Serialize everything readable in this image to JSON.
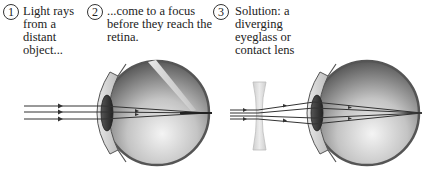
{
  "diagram": {
    "steps": [
      {
        "number": "1",
        "text": "Light rays\nfrom a\ndistant\nobject..."
      },
      {
        "number": "2",
        "text": "...come to a focus\nbefore they reach the\nretina."
      },
      {
        "number": "3",
        "text": "Solution: a\ndiverging\neyeglass or\ncontact lens"
      }
    ],
    "panels": [
      {
        "name": "uncorrected-eye",
        "rays": 3,
        "focus": "before retina"
      },
      {
        "name": "corrected-eye",
        "rays": 3,
        "lens": "diverging (concave)",
        "focus": "on retina"
      }
    ],
    "colors": {
      "ray": "#333333",
      "eye_outline": "#555555",
      "eye_dark": "#3a3a3a",
      "eye_light": "#f2f2f2",
      "lens": "#d6d6d6"
    }
  }
}
